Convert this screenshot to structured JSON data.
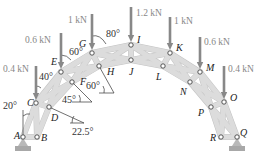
{
  "joints": [
    {
      "id": "A",
      "x": 23,
      "y": 137,
      "lx": 14,
      "ly": 139
    },
    {
      "id": "B",
      "x": 37,
      "y": 137,
      "lx": 41,
      "ly": 141
    },
    {
      "id": "C",
      "x": 36,
      "y": 103,
      "lx": 27,
      "ly": 106
    },
    {
      "id": "D",
      "x": 49,
      "y": 107,
      "lx": 51,
      "ly": 121
    },
    {
      "id": "E",
      "x": 61,
      "y": 72,
      "lx": 51,
      "ly": 65
    },
    {
      "id": "F",
      "x": 72,
      "y": 82,
      "lx": 80,
      "ly": 85
    },
    {
      "id": "G",
      "x": 92,
      "y": 53,
      "lx": 79,
      "ly": 47
    },
    {
      "id": "H",
      "x": 99,
      "y": 66,
      "lx": 107,
      "ly": 75
    },
    {
      "id": "I",
      "x": 131,
      "y": 45,
      "lx": 137,
      "ly": 43
    },
    {
      "id": "J",
      "x": 131,
      "y": 60,
      "lx": 129,
      "ly": 75
    },
    {
      "id": "K",
      "x": 170,
      "y": 53,
      "lx": 176,
      "ly": 51
    },
    {
      "id": "L",
      "x": 163,
      "y": 66,
      "lx": 156,
      "ly": 80
    },
    {
      "id": "M",
      "x": 200,
      "y": 72,
      "lx": 206,
      "ly": 71
    },
    {
      "id": "N",
      "x": 190,
      "y": 82,
      "lx": 180,
      "ly": 95
    },
    {
      "id": "O",
      "x": 224,
      "y": 102,
      "lx": 230,
      "ly": 101
    },
    {
      "id": "P",
      "x": 211,
      "y": 107,
      "lx": 198,
      "ly": 116
    },
    {
      "id": "R",
      "x": 221,
      "y": 137,
      "lx": 210,
      "ly": 141
    },
    {
      "id": "Q",
      "x": 237,
      "y": 137,
      "lx": 240,
      "ly": 136
    }
  ],
  "members": [
    [
      "A",
      "B"
    ],
    [
      "A",
      "C"
    ],
    [
      "B",
      "C"
    ],
    [
      "B",
      "D"
    ],
    [
      "C",
      "D"
    ],
    [
      "C",
      "E"
    ],
    [
      "D",
      "F"
    ],
    [
      "C",
      "F"
    ],
    [
      "E",
      "D"
    ],
    [
      "E",
      "F"
    ],
    [
      "E",
      "G"
    ],
    [
      "F",
      "H"
    ],
    [
      "E",
      "H"
    ],
    [
      "G",
      "F"
    ],
    [
      "G",
      "H"
    ],
    [
      "G",
      "I"
    ],
    [
      "H",
      "J"
    ],
    [
      "G",
      "J"
    ],
    [
      "H",
      "I"
    ],
    [
      "I",
      "J"
    ],
    [
      "I",
      "K"
    ],
    [
      "J",
      "L"
    ],
    [
      "I",
      "L"
    ],
    [
      "J",
      "K"
    ],
    [
      "K",
      "L"
    ],
    [
      "K",
      "M"
    ],
    [
      "L",
      "N"
    ],
    [
      "K",
      "N"
    ],
    [
      "L",
      "M"
    ],
    [
      "M",
      "N"
    ],
    [
      "M",
      "O"
    ],
    [
      "N",
      "P"
    ],
    [
      "M",
      "P"
    ],
    [
      "N",
      "O"
    ],
    [
      "O",
      "P"
    ],
    [
      "O",
      "R"
    ],
    [
      "P",
      "Q"
    ],
    [
      "O",
      "Q"
    ],
    [
      "P",
      "R"
    ],
    [
      "R",
      "Q"
    ]
  ],
  "loads": [
    {
      "joint": "C",
      "label": "0.4 kN",
      "x": 36,
      "y0": 66,
      "y1": 100,
      "lx": 3,
      "ly": 72
    },
    {
      "joint": "E",
      "label": "0.6 kN",
      "x": 61,
      "y0": 33,
      "y1": 69,
      "lx": 25,
      "ly": 43
    },
    {
      "joint": "G",
      "label": "1 kN",
      "x": 92,
      "y0": 14,
      "y1": 50,
      "lx": 68,
      "ly": 23
    },
    {
      "joint": "I",
      "label": "1.2 kN",
      "x": 131,
      "y0": 7,
      "y1": 42,
      "lx": 136,
      "ly": 16
    },
    {
      "joint": "K",
      "label": "1 kN",
      "x": 170,
      "y0": 17,
      "y1": 50,
      "lx": 174,
      "ly": 24
    },
    {
      "joint": "M",
      "label": "0.6 kN",
      "x": 200,
      "y0": 37,
      "y1": 69,
      "lx": 204,
      "ly": 45
    },
    {
      "joint": "O",
      "label": "0.4 kN",
      "x": 224,
      "y0": 66,
      "y1": 99,
      "lx": 228,
      "ly": 72
    }
  ],
  "angles": [
    {
      "label": "20°",
      "x": 3,
      "y": 109
    },
    {
      "label": "40°",
      "x": 39,
      "y": 80
    },
    {
      "label": "60°",
      "x": 69,
      "y": 55
    },
    {
      "label": "80°",
      "x": 106,
      "y": 37
    },
    {
      "label": "45°",
      "x": 62,
      "y": 103
    },
    {
      "label": "60°",
      "x": 86,
      "y": 89
    },
    {
      "label": "22.5°",
      "x": 72,
      "y": 135
    }
  ],
  "supports": [
    {
      "name": "pin-support-A",
      "x": 23,
      "y": 137
    },
    {
      "name": "pin-support-Q",
      "x": 237,
      "y": 137
    }
  ]
}
